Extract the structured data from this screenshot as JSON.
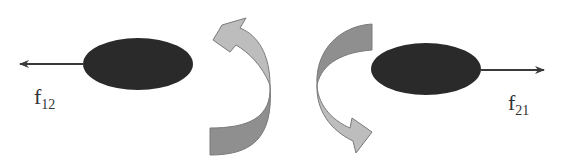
{
  "diagram": {
    "bodies": [
      {
        "id": "body-1",
        "force_label": "f",
        "force_subscript": "12",
        "force_direction": "left"
      },
      {
        "id": "body-2",
        "force_label": "f",
        "force_subscript": "21",
        "force_direction": "right"
      }
    ],
    "rotation_arrows": [
      {
        "id": "rotation-left",
        "direction": "counterclockwise-up"
      },
      {
        "id": "rotation-right",
        "direction": "clockwise-down"
      }
    ],
    "colors": {
      "body": "#2a2a2a",
      "force_arrow": "#3a3a3a",
      "rotation_light": "#bdbdbd",
      "rotation_dark": "#8f8f8f",
      "rotation_outline": "#7a7a7a"
    }
  }
}
